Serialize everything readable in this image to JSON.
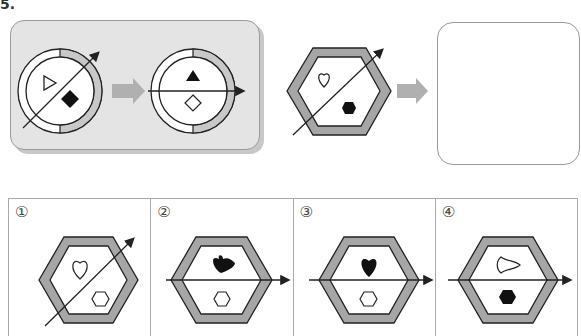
{
  "question": {
    "number": "5.",
    "example_title": "Example transformation",
    "answer_placeholder": ""
  },
  "example": {
    "before": {
      "shape": "ring-circle",
      "arrow": "diagonal",
      "top_symbol": "white-triangle-right",
      "bottom_symbol": "black-diamond"
    },
    "after": {
      "shape": "ring-circle",
      "arrow": "horizontal",
      "top_symbol": "black-triangle-up",
      "bottom_symbol": "white-diamond"
    }
  },
  "problem": {
    "shape": "hexagon-frame",
    "arrow": "diagonal",
    "top_symbol": "white-heart",
    "bottom_symbol": "black-hexagon"
  },
  "choices": [
    {
      "label": "①",
      "arrow": "diagonal",
      "top_symbol": "white-heart",
      "bottom_symbol": "white-hexagon"
    },
    {
      "label": "②",
      "arrow": "horizontal",
      "top_symbol": "black-heart-rotated",
      "bottom_symbol": "white-hexagon"
    },
    {
      "label": "③",
      "arrow": "horizontal",
      "top_symbol": "black-heart",
      "bottom_symbol": "white-hexagon"
    },
    {
      "label": "④",
      "arrow": "horizontal",
      "top_symbol": "white-heart-rotated",
      "bottom_symbol": "black-hexagon"
    }
  ],
  "colors": {
    "frame_gray": "#a6a6a6",
    "arrow_gray": "#b0b0b0",
    "panel_bg": "#e4e4e4",
    "stroke": "#222222"
  }
}
